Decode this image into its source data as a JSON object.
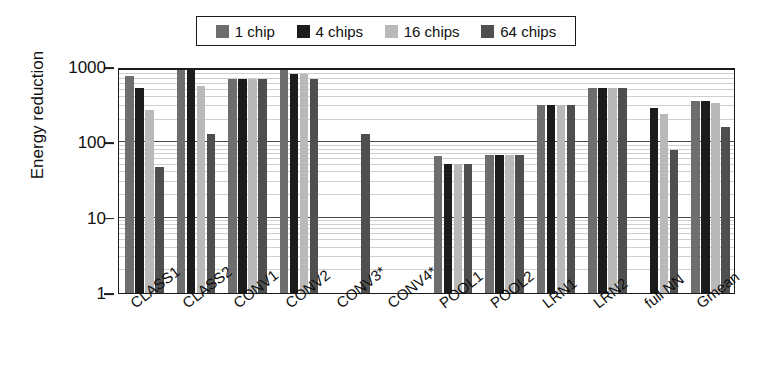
{
  "chart_data": {
    "type": "bar",
    "title": "",
    "xlabel": "",
    "ylabel": "Energy reduction",
    "yscale": "log",
    "ylim": [
      1,
      1000
    ],
    "ytick_labels": [
      "1000",
      "100",
      "10",
      "1"
    ],
    "ytick_values": [
      1000,
      100,
      10,
      1
    ],
    "grid": true,
    "legend_position": "top",
    "categories": [
      "CLASS1",
      "CLASS2",
      "CONV1",
      "CONV2",
      "CONV3*",
      "CONV4*",
      "POOL1",
      "POOL2",
      "LRN1",
      "LRN2",
      "full NN",
      "Gmean"
    ],
    "series": [
      {
        "name": "1 chip",
        "color": "#6e6e6e",
        "values": [
          750,
          1000,
          700,
          900,
          null,
          null,
          66,
          68,
          310,
          520,
          null,
          350
        ]
      },
      {
        "name": "4 chips",
        "color": "#1c1c1c",
        "values": [
          520,
          1000,
          700,
          820,
          null,
          null,
          52,
          68,
          310,
          520,
          290,
          350
        ]
      },
      {
        "name": "16 chips",
        "color": "#b9b9b9",
        "values": [
          270,
          560,
          700,
          820,
          null,
          null,
          52,
          68,
          310,
          520,
          240,
          330
        ]
      },
      {
        "name": "64 chips",
        "color": "#4f4f4f",
        "values": [
          47,
          130,
          700,
          700,
          130,
          null,
          52,
          68,
          310,
          520,
          78,
          160
        ]
      }
    ]
  },
  "legend": {
    "items": [
      {
        "label": "1 chip",
        "color": "#6e6e6e"
      },
      {
        "label": "4 chips",
        "color": "#1c1c1c"
      },
      {
        "label": "16 chips",
        "color": "#b9b9b9"
      },
      {
        "label": "64 chips",
        "color": "#4f4f4f"
      }
    ]
  },
  "axes": {
    "y_title": "Energy reduction",
    "y_ticks": [
      "1000",
      "100",
      "10",
      "1"
    ]
  }
}
